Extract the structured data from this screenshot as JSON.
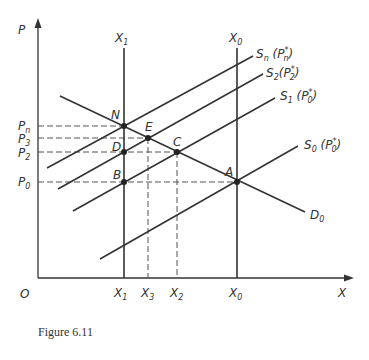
{
  "figure": {
    "caption": "Figure 6.11",
    "axes": {
      "y_label": "P",
      "x_label": "X",
      "origin_label": "O"
    },
    "y_ticks": [
      {
        "base": "P",
        "sub": "n",
        "y": 126
      },
      {
        "base": "P",
        "sub": "3",
        "y": 138
      },
      {
        "base": "P",
        "sub": "2",
        "y": 152
      },
      {
        "base": "P",
        "sub": "0",
        "y": 182
      }
    ],
    "x_ticks": [
      {
        "base": "X",
        "sub": "1",
        "x": 124
      },
      {
        "base": "X",
        "sub": "3",
        "x": 148
      },
      {
        "base": "X",
        "sub": "2",
        "x": 177
      },
      {
        "base": "X",
        "sub": "0",
        "x": 237
      }
    ],
    "vertical_lines": [
      {
        "base": "X",
        "sub": "1",
        "x": 124
      },
      {
        "base": "X",
        "sub": "0",
        "x": 237
      }
    ],
    "curves": [
      {
        "id": "Sn",
        "base": "S",
        "sub": "n",
        "arg_base": "P",
        "arg_sub": "n",
        "arg_sup": "*",
        "from": [
          47,
          168
        ],
        "to": [
          253,
          56
        ]
      },
      {
        "id": "S2",
        "base": "S",
        "sub": "2",
        "arg_base": "P",
        "arg_sub": "2",
        "arg_sup": "*",
        "from": [
          58,
          189
        ],
        "to": [
          263,
          74
        ]
      },
      {
        "id": "S1",
        "base": "S",
        "sub": "1",
        "arg_base": "P",
        "arg_sub": "0",
        "arg_sup": "*",
        "from": [
          73,
          211
        ],
        "to": [
          275,
          98
        ]
      },
      {
        "id": "S0",
        "base": "S",
        "sub": "0",
        "arg_base": "P",
        "arg_sub": "0",
        "arg_sup": "*",
        "from": [
          100,
          259
        ],
        "to": [
          298,
          146
        ]
      },
      {
        "id": "D0",
        "base": "D",
        "sub": "0",
        "from": [
          60,
          96
        ],
        "to": [
          305,
          212
        ]
      }
    ],
    "points": [
      {
        "label": "N",
        "x": 124,
        "y": 126
      },
      {
        "label": "E",
        "x": 148,
        "y": 138
      },
      {
        "label": "D",
        "x": 124,
        "y": 152
      },
      {
        "label": "C",
        "x": 177,
        "y": 152
      },
      {
        "label": "B",
        "x": 124,
        "y": 182
      },
      {
        "label": "A",
        "x": 237,
        "y": 182
      }
    ]
  }
}
